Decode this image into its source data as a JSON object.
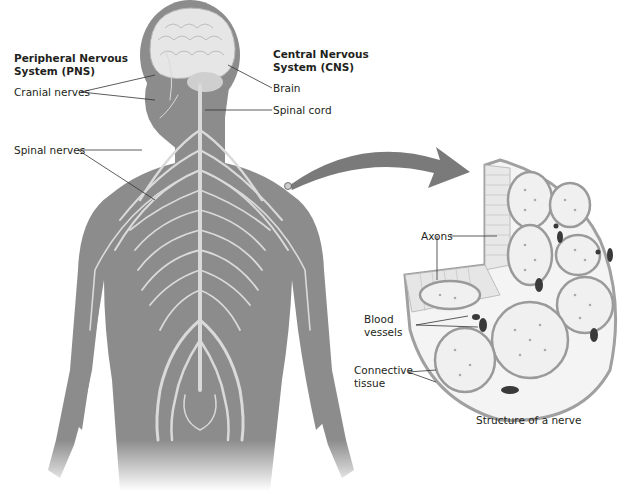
{
  "labels": {
    "pns_title_1": "Peripheral Nervous",
    "pns_title_2": "System (PNS)",
    "cns_title_1": "Central Nervous",
    "cns_title_2": "System (CNS)",
    "cranial_nerves": "Cranial nerves",
    "spinal_nerves": "Spinal nerves",
    "brain": "Brain",
    "spinal_cord": "Spinal cord",
    "axons": "Axons",
    "blood_vessels_1": "Blood",
    "blood_vessels_2": "vessels",
    "connective_tissue_1": "Connective",
    "connective_tissue_2": "tissue",
    "caption": "Structure of a nerve"
  },
  "colors": {
    "body": "#8c8c8c",
    "nerve": "#dadada",
    "brain": "#e6e6e6",
    "arrow": "#7a7a7a",
    "fascicle_fill": "#f0f0f0",
    "fascicle_border": "#9a9a9a",
    "vessel": "#3a3a3a",
    "leader_line": "#333333"
  }
}
